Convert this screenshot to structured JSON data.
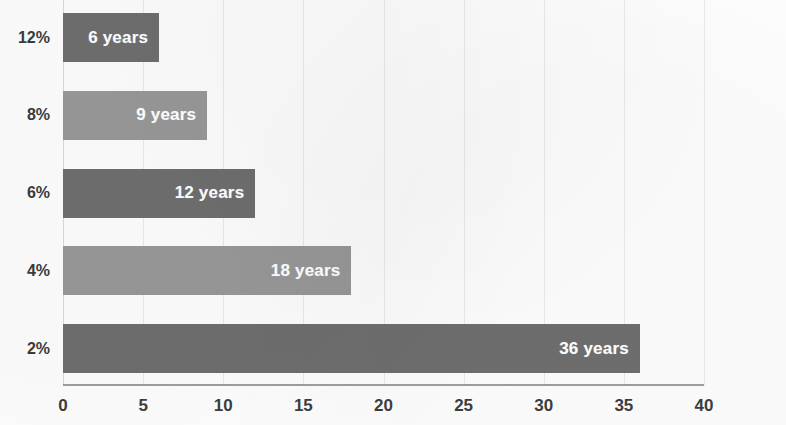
{
  "chart_data": {
    "type": "bar",
    "orientation": "horizontal",
    "title": "",
    "subtitle": "",
    "xlabel": "",
    "ylabel": "",
    "categories": [
      "12%",
      "8%",
      "6%",
      "4%",
      "2%"
    ],
    "values": [
      6,
      9,
      12,
      18,
      36
    ],
    "data_labels": [
      "6 years",
      "9 years",
      "12 years",
      "18 years",
      "36 years"
    ],
    "bar_colors": [
      "#6e6e6e",
      "#989898",
      "#6e6e6e",
      "#989898",
      "#6e6e6e"
    ],
    "xlim": [
      0,
      40
    ],
    "xticks": [
      0,
      5,
      10,
      15,
      20,
      25,
      30,
      35,
      40
    ],
    "xtick_labels": [
      "0",
      "5",
      "10",
      "15",
      "20",
      "25",
      "30",
      "35",
      "40"
    ],
    "grid": "vertical",
    "legend": "none",
    "series": [
      {
        "name": "Years to double",
        "values": [
          6,
          9,
          12,
          18,
          36
        ]
      }
    ],
    "bars": [
      {
        "category": "12%",
        "value": 6,
        "label": "6 years",
        "color": "#6e6e6e"
      },
      {
        "category": "8%",
        "value": 9,
        "label": "9 years",
        "color": "#989898"
      },
      {
        "category": "6%",
        "value": 12,
        "label": "12 years",
        "color": "#6e6e6e"
      },
      {
        "category": "4%",
        "value": 18,
        "label": "18 years",
        "color": "#989898"
      },
      {
        "category": "2%",
        "value": 36,
        "label": "36 years",
        "color": "#6e6e6e"
      }
    ]
  }
}
